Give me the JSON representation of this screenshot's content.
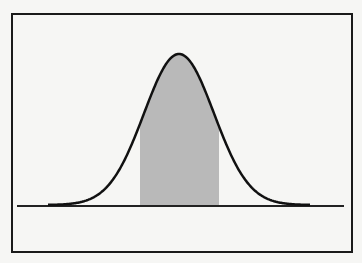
{
  "diagram": {
    "title": "",
    "type": "normal distribution curve with shaded central region",
    "colors": {
      "curve": "#111111",
      "shade": "#b9b9b9",
      "baseline": "#222222",
      "frame": "#1a1a1a",
      "background": "#f6f6f4"
    },
    "curve": {
      "peak_x": 179,
      "peak_y": 54,
      "baseline_y": 205,
      "sigma_px": 35
    },
    "shaded_region": {
      "x_start": 140,
      "x_end": 219
    },
    "baseline": {
      "x_start": 17,
      "x_end": 344
    }
  }
}
